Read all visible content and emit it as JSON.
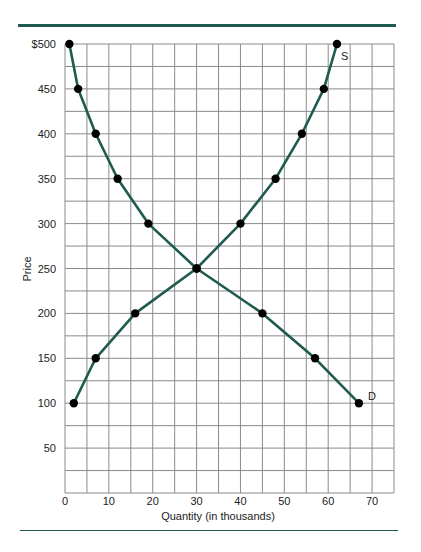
{
  "chart_data": {
    "type": "line",
    "title": "",
    "xlabel": "Quantity (in thousands)",
    "ylabel": "Price",
    "xlim": [
      0,
      75
    ],
    "ylim": [
      0,
      500
    ],
    "x_ticks": [
      "0",
      "10",
      "20",
      "30",
      "40",
      "50",
      "60",
      "70"
    ],
    "y_ticks": [
      "50",
      "100",
      "150",
      "200",
      "250",
      "300",
      "350",
      "400",
      "450",
      "$500"
    ],
    "grid": true,
    "grid_x_step": 5,
    "grid_y_step": 25,
    "legend": "none",
    "series": [
      {
        "name": "D",
        "label": "D",
        "points": [
          {
            "x": 1,
            "y": 500
          },
          {
            "x": 3,
            "y": 450
          },
          {
            "x": 7,
            "y": 400
          },
          {
            "x": 12,
            "y": 350
          },
          {
            "x": 19,
            "y": 300
          },
          {
            "x": 30,
            "y": 250
          },
          {
            "x": 45,
            "y": 200
          },
          {
            "x": 57,
            "y": 150
          },
          {
            "x": 67,
            "y": 100
          }
        ]
      },
      {
        "name": "S",
        "label": "S",
        "points": [
          {
            "x": 2,
            "y": 100
          },
          {
            "x": 7,
            "y": 150
          },
          {
            "x": 16,
            "y": 200
          },
          {
            "x": 30,
            "y": 250
          },
          {
            "x": 40,
            "y": 300
          },
          {
            "x": 48,
            "y": 350
          },
          {
            "x": 54,
            "y": 400
          },
          {
            "x": 59,
            "y": 450
          },
          {
            "x": 62,
            "y": 500
          }
        ]
      }
    ],
    "colors": {
      "line": "#1f5a50",
      "marker": "#000000",
      "grid": "#8a8a8a",
      "rule": "#1f5a50"
    }
  }
}
